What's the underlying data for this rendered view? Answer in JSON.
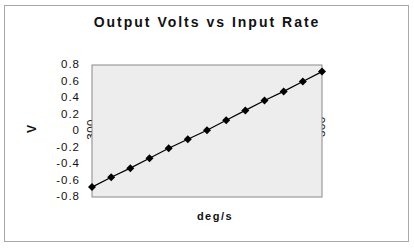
{
  "chart_data": {
    "type": "line",
    "title": "Output Volts vs Input Rate",
    "xlabel": "deg/s",
    "ylabel": "V",
    "x": [
      -300,
      -250,
      -200,
      -150,
      -100,
      -50,
      0,
      50,
      100,
      150,
      200,
      250,
      300
    ],
    "series": [
      {
        "name": "Output Volts",
        "values": [
          -0.68,
          -0.56,
          -0.45,
          -0.33,
          -0.21,
          -0.1,
          0.01,
          0.13,
          0.25,
          0.37,
          0.48,
          0.6,
          0.72
        ]
      }
    ],
    "xlim": [
      -300,
      300
    ],
    "ylim": [
      -0.8,
      0.8
    ],
    "x_ticks": [
      "-300",
      "-200",
      "-100",
      "0",
      "100",
      "200",
      "300"
    ],
    "y_ticks": [
      "0.8",
      "0.6",
      "0.4",
      "0.2",
      "0",
      "-0.2",
      "-0.4",
      "-0.6",
      "-0.8"
    ],
    "grid": false,
    "legend": "none",
    "plot_background": "#ededed",
    "line_color": "#000000",
    "marker": "diamond"
  }
}
